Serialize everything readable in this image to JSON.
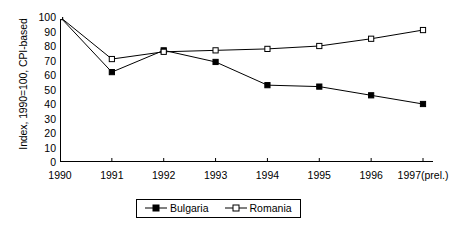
{
  "chart_data": {
    "type": "line",
    "title": "",
    "xlabel": "",
    "ylabel": "Index, 1990=100, CPI-based",
    "categories": [
      "1990",
      "1991",
      "1992",
      "1993",
      "1994",
      "1995",
      "1996",
      "1997(prel.)"
    ],
    "ylim": [
      0,
      100
    ],
    "yticks": [
      0,
      10,
      20,
      30,
      40,
      50,
      60,
      70,
      80,
      90,
      100
    ],
    "grid": false,
    "legend_position": "bottom-center",
    "series": [
      {
        "name": "Bulgaria",
        "marker": "filled-square",
        "color": "#000000",
        "values": [
          100,
          62,
          77,
          69,
          53,
          52,
          46,
          40
        ]
      },
      {
        "name": "Romania",
        "marker": "open-square",
        "color": "#000000",
        "values": [
          100,
          71,
          76,
          77,
          78,
          80,
          85,
          91
        ]
      }
    ]
  },
  "axis": {
    "y_title": "Index, 1990=100, CPI-based",
    "y_tick_labels": [
      "100",
      "90",
      "80",
      "70",
      "60",
      "50",
      "40",
      "30",
      "20",
      "10",
      "0"
    ],
    "x_tick_labels": [
      "1990",
      "1991",
      "1992",
      "1993",
      "1994",
      "1995",
      "1996",
      "1997(prel.)"
    ]
  },
  "legend": {
    "items": [
      {
        "label": "Bulgaria",
        "marker": "filled-square"
      },
      {
        "label": "Romania",
        "marker": "open-square"
      }
    ]
  },
  "colors": {
    "axis": "#000000",
    "line": "#000000",
    "background": "#ffffff"
  }
}
